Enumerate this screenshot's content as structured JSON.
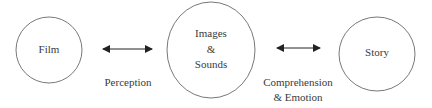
{
  "diagram": {
    "nodes": [
      {
        "id": "film",
        "label": "Film"
      },
      {
        "id": "images_sounds",
        "label_lines": [
          "Images",
          "&",
          "Sounds"
        ]
      },
      {
        "id": "story",
        "label": "Story"
      }
    ],
    "edges": [
      {
        "from": "film",
        "to": "images_sounds",
        "type": "bidirectional-arrow",
        "label": "Perception"
      },
      {
        "from": "images_sounds",
        "to": "story",
        "type": "bidirectional-arrow",
        "label_lines": [
          "Comprehension",
          "& Emotion"
        ]
      }
    ],
    "colors": {
      "stroke": "#555555",
      "text": "#3a3a3a",
      "background": "#ffffff"
    }
  }
}
